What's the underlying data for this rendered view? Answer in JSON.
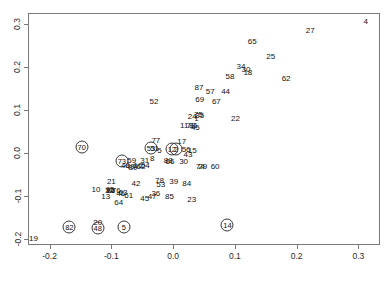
{
  "chart_data": {
    "type": "scatter",
    "title": "",
    "xlabel": "",
    "ylabel": "",
    "xlim": [
      -0.235,
      0.335
    ],
    "ylim": [
      -0.215,
      0.325
    ],
    "grid": false,
    "legend": null,
    "point_render": "text-labels",
    "note": "Each point is drawn as its numeric case label; some labels are enclosed in a circle marker.",
    "xticks": [
      "-0.2",
      "-0.1",
      "0.0",
      "0.1",
      "0.2",
      "0.3"
    ],
    "xtickvalues": [
      -0.2,
      -0.1,
      0.0,
      0.1,
      0.2,
      0.3
    ],
    "yticks": [
      "-0.2",
      "-0.1",
      "0.0",
      "0.1",
      "0.2",
      "0.3"
    ],
    "ytickvalues": [
      -0.2,
      -0.1,
      0.0,
      0.1,
      0.2,
      0.3
    ],
    "points": [
      {
        "label": "4",
        "x": 0.312,
        "y": 0.304,
        "circled": false
      },
      {
        "label": "27",
        "x": 0.222,
        "y": 0.283,
        "circled": false
      },
      {
        "label": "65",
        "x": 0.128,
        "y": 0.258,
        "circled": false
      },
      {
        "label": "25",
        "x": 0.158,
        "y": 0.222,
        "circled": false
      },
      {
        "label": "34",
        "x": 0.11,
        "y": 0.2,
        "circled": false
      },
      {
        "label": "30",
        "x": 0.118,
        "y": 0.193,
        "circled": false
      },
      {
        "label": "18",
        "x": 0.121,
        "y": 0.185,
        "circled": false
      },
      {
        "label": "58",
        "x": 0.092,
        "y": 0.175,
        "circled": false
      },
      {
        "label": "62",
        "x": 0.183,
        "y": 0.172,
        "circled": false
      },
      {
        "label": "87",
        "x": 0.042,
        "y": 0.151,
        "circled": false
      },
      {
        "label": "57",
        "x": 0.06,
        "y": 0.141,
        "circled": false
      },
      {
        "label": "44",
        "x": 0.085,
        "y": 0.14,
        "circled": false
      },
      {
        "label": "52",
        "x": -0.031,
        "y": 0.119,
        "circled": false
      },
      {
        "label": "69",
        "x": 0.043,
        "y": 0.122,
        "circled": false
      },
      {
        "label": "67",
        "x": 0.07,
        "y": 0.117,
        "circled": false
      },
      {
        "label": "24",
        "x": 0.031,
        "y": 0.084,
        "circled": false
      },
      {
        "label": "75",
        "x": 0.041,
        "y": 0.088,
        "circled": false
      },
      {
        "label": "35",
        "x": 0.043,
        "y": 0.085,
        "circled": false
      },
      {
        "label": "22",
        "x": 0.101,
        "y": 0.078,
        "circled": false
      },
      {
        "label": "1",
        "x": 0.038,
        "y": 0.078,
        "circled": false
      },
      {
        "label": "11",
        "x": 0.018,
        "y": 0.063,
        "circled": false
      },
      {
        "label": "78",
        "x": 0.029,
        "y": 0.063,
        "circled": false
      },
      {
        "label": "81",
        "x": 0.033,
        "y": 0.061,
        "circled": false
      },
      {
        "label": "45",
        "x": 0.036,
        "y": 0.058,
        "circled": false
      },
      {
        "label": "77",
        "x": -0.028,
        "y": 0.028,
        "circled": false
      },
      {
        "label": "17",
        "x": 0.014,
        "y": 0.025,
        "circled": false
      },
      {
        "label": "53",
        "x": -0.036,
        "y": 0.011,
        "circled": true
      },
      {
        "label": "51",
        "x": -0.03,
        "y": 0.009,
        "circled": false
      },
      {
        "label": "5",
        "x": -0.022,
        "y": 0.004,
        "circled": false
      },
      {
        "label": "12",
        "x": -0.002,
        "y": 0.009,
        "circled": true
      },
      {
        "label": "2",
        "x": 0.005,
        "y": 0.009,
        "circled": true
      },
      {
        "label": "56",
        "x": 0.021,
        "y": 0.006,
        "circled": false
      },
      {
        "label": "15",
        "x": 0.031,
        "y": 0.004,
        "circled": false
      },
      {
        "label": "43",
        "x": 0.024,
        "y": -0.006,
        "circled": false
      },
      {
        "label": "70",
        "x": -0.148,
        "y": 0.012,
        "circled": true
      },
      {
        "label": "73",
        "x": -0.083,
        "y": -0.019,
        "circled": true
      },
      {
        "label": "59",
        "x": -0.067,
        "y": -0.02,
        "circled": false
      },
      {
        "label": "31",
        "x": -0.046,
        "y": -0.02,
        "circled": false
      },
      {
        "label": "8",
        "x": -0.034,
        "y": -0.014,
        "circled": false
      },
      {
        "label": "88",
        "x": -0.008,
        "y": -0.019,
        "circled": false
      },
      {
        "label": "66",
        "x": -0.005,
        "y": -0.022,
        "circled": false
      },
      {
        "label": "30",
        "x": 0.017,
        "y": -0.021,
        "circled": false
      },
      {
        "label": "40",
        "x": -0.077,
        "y": -0.031,
        "circled": false
      },
      {
        "label": "49",
        "x": -0.07,
        "y": -0.034,
        "circled": false
      },
      {
        "label": "89",
        "x": -0.065,
        "y": -0.035,
        "circled": false
      },
      {
        "label": "7",
        "x": -0.062,
        "y": -0.034,
        "circled": false
      },
      {
        "label": "16",
        "x": -0.057,
        "y": -0.031,
        "circled": false
      },
      {
        "label": "62",
        "x": -0.052,
        "y": -0.033,
        "circled": false
      },
      {
        "label": "54",
        "x": -0.045,
        "y": -0.031,
        "circled": false
      },
      {
        "label": "74",
        "x": 0.044,
        "y": -0.033,
        "circled": false
      },
      {
        "label": "29",
        "x": 0.048,
        "y": -0.033,
        "circled": false
      },
      {
        "label": "60",
        "x": 0.068,
        "y": -0.033,
        "circled": false
      },
      {
        "label": "21",
        "x": -0.1,
        "y": -0.068,
        "circled": false
      },
      {
        "label": "42",
        "x": -0.06,
        "y": -0.072,
        "circled": false
      },
      {
        "label": "78",
        "x": -0.022,
        "y": -0.067,
        "circled": false
      },
      {
        "label": "39",
        "x": 0.001,
        "y": -0.069,
        "circled": false
      },
      {
        "label": "84",
        "x": 0.022,
        "y": -0.072,
        "circled": false
      },
      {
        "label": "53",
        "x": -0.02,
        "y": -0.076,
        "circled": false
      },
      {
        "label": "10",
        "x": -0.125,
        "y": -0.087,
        "circled": false
      },
      {
        "label": "32",
        "x": -0.103,
        "y": -0.089,
        "circled": false
      },
      {
        "label": "95",
        "x": -0.102,
        "y": -0.087,
        "circled": false
      },
      {
        "label": "86",
        "x": -0.101,
        "y": -0.09,
        "circled": false
      },
      {
        "label": "76",
        "x": -0.092,
        "y": -0.089,
        "circled": false
      },
      {
        "label": "63",
        "x": -0.081,
        "y": -0.095,
        "circled": false
      },
      {
        "label": "46",
        "x": -0.085,
        "y": -0.097,
        "circled": false
      },
      {
        "label": "36",
        "x": -0.028,
        "y": -0.097,
        "circled": false
      },
      {
        "label": "13",
        "x": -0.109,
        "y": -0.103,
        "circled": false
      },
      {
        "label": "61",
        "x": -0.072,
        "y": -0.102,
        "circled": false
      },
      {
        "label": "47",
        "x": -0.034,
        "y": -0.104,
        "circled": false
      },
      {
        "label": "45",
        "x": -0.046,
        "y": -0.108,
        "circled": false
      },
      {
        "label": "85",
        "x": -0.006,
        "y": -0.104,
        "circled": false
      },
      {
        "label": "23",
        "x": 0.03,
        "y": -0.11,
        "circled": false
      },
      {
        "label": "64",
        "x": -0.088,
        "y": -0.117,
        "circled": false
      },
      {
        "label": "20",
        "x": -0.122,
        "y": -0.163,
        "circled": false
      },
      {
        "label": "48",
        "x": -0.122,
        "y": -0.175,
        "circled": true
      },
      {
        "label": "82",
        "x": -0.168,
        "y": -0.172,
        "circled": true
      },
      {
        "label": "5",
        "x": -0.08,
        "y": -0.172,
        "circled": true
      },
      {
        "label": "14",
        "x": 0.088,
        "y": -0.168,
        "circled": true
      },
      {
        "label": "19",
        "x": -0.226,
        "y": -0.202,
        "circled": false
      }
    ]
  }
}
